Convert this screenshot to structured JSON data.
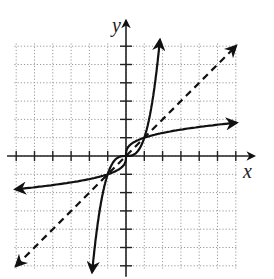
{
  "chart_data": {
    "type": "line",
    "title": "",
    "xlabel": "x",
    "ylabel": "y",
    "xlim": [
      -6,
      6
    ],
    "ylim": [
      -6,
      6
    ],
    "grid": true,
    "grid_style": "dotted",
    "tick_step": 1,
    "series": [
      {
        "name": "f(x) = x^3",
        "style": "solid",
        "arrows": "both",
        "x": [
          -1.85,
          -1.5,
          -1,
          -0.5,
          0,
          0.5,
          1,
          1.5,
          1.85
        ],
        "y": [
          -6.3,
          -3.375,
          -1,
          -0.125,
          0,
          0.125,
          1,
          3.375,
          6.3
        ]
      },
      {
        "name": "f^-1(x) = cube root of x",
        "style": "solid",
        "arrows": "both",
        "x": [
          -6,
          -3.375,
          -1,
          -0.125,
          0,
          0.125,
          1,
          3.375,
          6
        ],
        "y": [
          -1.82,
          -1.5,
          -1,
          -0.5,
          0,
          0.5,
          1,
          1.5,
          1.82
        ]
      },
      {
        "name": "y = x",
        "style": "dashed",
        "arrows": "both",
        "x": [
          -6,
          6
        ],
        "y": [
          -6,
          6
        ]
      }
    ],
    "intersections": [
      [
        -1,
        -1
      ],
      [
        0,
        0
      ],
      [
        1,
        1
      ]
    ]
  },
  "axes": {
    "x_label": "x",
    "y_label": "y"
  },
  "colors": {
    "curve": "#111111",
    "grid": "#9a9a9a",
    "axis": "#222222"
  }
}
